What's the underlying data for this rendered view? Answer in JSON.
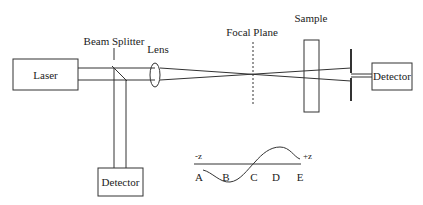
{
  "diagram": {
    "type": "z-scan optical setup",
    "components": {
      "laser": {
        "label": "Laser"
      },
      "beam_splitter": {
        "label": "Beam Splitter"
      },
      "lens": {
        "label": "Lens"
      },
      "focal_plane": {
        "label": "Focal Plane"
      },
      "sample": {
        "label": "Sample"
      },
      "detector_right": {
        "label": "Detector"
      },
      "detector_bottom": {
        "label": "Detector"
      }
    },
    "inset_curve": {
      "axis_left": "-z",
      "axis_right": "+z",
      "points": [
        "A",
        "B",
        "C",
        "D",
        "E"
      ]
    }
  },
  "colors": {
    "stroke": "#333333",
    "background": "#ffffff"
  }
}
